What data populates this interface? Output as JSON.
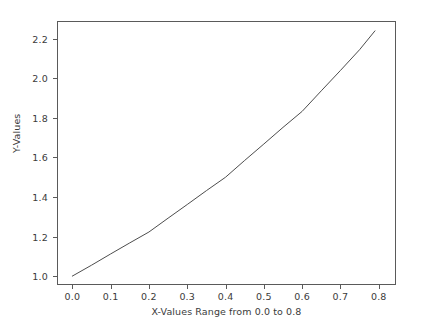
{
  "chart_data": {
    "type": "line",
    "title": "",
    "xlabel": "X-Values Range from 0.0 to 0.8",
    "ylabel": "Y-Values",
    "xlim": [
      -0.04,
      0.845
    ],
    "ylim": [
      0.955,
      2.29
    ],
    "xticks": [
      "0.0",
      "0.1",
      "0.2",
      "0.3",
      "0.4",
      "0.5",
      "0.6",
      "0.7",
      "0.8"
    ],
    "xtick_values": [
      0.0,
      0.1,
      0.2,
      0.3,
      0.4,
      0.5,
      0.6,
      0.7,
      0.8
    ],
    "yticks": [
      "1.0",
      "1.2",
      "1.4",
      "1.6",
      "1.8",
      "2.0",
      "2.2"
    ],
    "ytick_values": [
      1.0,
      1.2,
      1.4,
      1.6,
      1.8,
      2.0,
      2.2
    ],
    "grid": false,
    "legend": false,
    "line_color": "#4d4d4d",
    "line_width": 1.0,
    "series": [
      {
        "name": "y",
        "x": [
          0.0,
          0.05,
          0.1,
          0.15,
          0.2,
          0.25,
          0.3,
          0.35,
          0.4,
          0.45,
          0.5,
          0.55,
          0.6,
          0.65,
          0.7,
          0.75,
          0.79
        ],
        "values": [
          1.0,
          1.055,
          1.112,
          1.168,
          1.223,
          1.293,
          1.362,
          1.432,
          1.5,
          1.585,
          1.668,
          1.752,
          1.833,
          1.937,
          2.04,
          2.145,
          2.24
        ]
      }
    ]
  }
}
